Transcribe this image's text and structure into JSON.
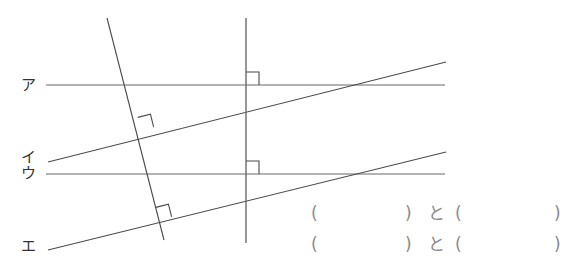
{
  "figure": {
    "labels": [
      {
        "name": "label-a",
        "text": "ア",
        "x": 21,
        "y": 78
      },
      {
        "name": "label-i",
        "text": "イ",
        "x": 21,
        "y": 150
      },
      {
        "name": "label-u",
        "text": "ウ",
        "x": 21,
        "y": 166
      },
      {
        "name": "label-e",
        "text": "エ",
        "x": 21,
        "y": 239
      }
    ],
    "colors": {
      "horizontal_line": "#9a9a9a",
      "slanted_line": "#4a4a4a",
      "steep_line": "#4a4a4a",
      "vertical_line": "#6a6a6a",
      "right_angle_mark": "#4a4a4a",
      "label_text": "#333333",
      "answer_text": "#8a8a8a"
    },
    "lines": [
      {
        "name": "line-a-horizontal",
        "x1": 46,
        "y1": 85,
        "x2": 445,
        "y2": 85,
        "kind": "horizontal"
      },
      {
        "name": "line-u-horizontal",
        "x1": 46,
        "y1": 174,
        "x2": 445,
        "y2": 174,
        "kind": "horizontal"
      },
      {
        "name": "line-i-slanted",
        "x1": 48,
        "y1": 162,
        "x2": 446,
        "y2": 62,
        "kind": "slanted"
      },
      {
        "name": "line-e-slanted",
        "x1": 48,
        "y1": 250,
        "x2": 446,
        "y2": 152,
        "kind": "slanted"
      },
      {
        "name": "line-steep",
        "x1": 107,
        "y1": 18,
        "x2": 164,
        "y2": 240,
        "kind": "steep"
      },
      {
        "name": "line-vertical",
        "x1": 246,
        "y1": 18,
        "x2": 246,
        "y2": 243,
        "kind": "vertical"
      }
    ],
    "right_angle_marks": [
      {
        "name": "right-angle-mark-vertical-a",
        "x": 246,
        "y": 85,
        "size": 13,
        "rotation": 0
      },
      {
        "name": "right-angle-mark-vertical-u",
        "x": 246,
        "y": 174,
        "size": 13,
        "rotation": 0
      },
      {
        "name": "right-angle-mark-steep-i",
        "x": 141,
        "y": 130,
        "size": 13,
        "rotation": -14.1
      },
      {
        "name": "right-angle-mark-steep-e",
        "x": 159,
        "y": 220,
        "size": 13,
        "rotation": -14.1
      }
    ]
  },
  "answers": {
    "rows": [
      {
        "name": "answer-row-1",
        "paren_open_1": "(",
        "paren_close_1": ")",
        "conjunction": "と",
        "paren_open_2": "(",
        "paren_close_2": ")"
      },
      {
        "name": "answer-row-2",
        "paren_open_1": "(",
        "paren_close_1": ")",
        "conjunction": "と",
        "paren_open_2": "(",
        "paren_close_2": ")"
      }
    ]
  }
}
